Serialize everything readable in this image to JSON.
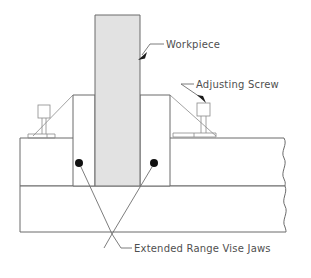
{
  "diagram": {
    "background_color": "#ffffff",
    "line_color": "#6b6b6b",
    "workpiece_fill": "#e2e2e2",
    "marker_color": "#111111"
  },
  "labels": {
    "workpiece": "Workpiece",
    "adjusting_screw": "Adjusting Screw",
    "vise_jaws": "Extended Range Vise Jaws"
  },
  "parts": {
    "workpiece": {
      "name": "workpiece",
      "x": 95,
      "y": 15,
      "width": 45,
      "height": 171
    },
    "left_jaw": {
      "name": "left-vise-jaw",
      "x": 73,
      "y": 95,
      "width": 22,
      "height": 91
    },
    "right_jaw": {
      "name": "right-vise-jaw",
      "x": 140,
      "y": 95,
      "width": 30,
      "height": 91
    },
    "vise_body_upper": {
      "name": "vise-body-upper",
      "x": 20,
      "y": 138,
      "width": 265,
      "height": 48
    },
    "vise_body_lower": {
      "name": "vise-body-lower",
      "x": 20,
      "y": 186,
      "width": 265,
      "height": 46
    },
    "left_adjusting_screw": {
      "name": "left-adjusting-screw",
      "x": 38,
      "y": 105,
      "width": 12,
      "height": 13
    },
    "right_adjusting_screw": {
      "name": "right-adjusting-screw",
      "x": 197,
      "y": 103,
      "width": 13,
      "height": 13
    },
    "left_jaw_marker": {
      "name": "left-jaw-marker",
      "cx": 79,
      "cy": 163,
      "r": 4
    },
    "right_jaw_marker": {
      "name": "right-jaw-marker",
      "cx": 154,
      "cy": 163,
      "r": 4
    }
  },
  "label_positions": {
    "workpiece": {
      "x": 166,
      "y": 48
    },
    "adjusting_screw": {
      "x": 196,
      "y": 88
    },
    "vise_jaws": {
      "x": 134,
      "y": 252
    }
  },
  "leaders": {
    "workpiece": {
      "name": "workpiece-leader",
      "path": "M 163 44 L 150 44 L 141 57",
      "arrow_tip": {
        "x": 140,
        "y": 59
      }
    },
    "adjusting_screw": {
      "name": "adjusting-screw-leader",
      "path": "M 193 84 L 180 84 L 206 100",
      "arrow_tip": {
        "x": 205,
        "y": 101
      }
    },
    "vise_jaws": {
      "name": "vise-jaws-leader",
      "path": "M 131 248 L 120 248 L 112 233 L 104 248 L 82 167 M 112 233 L 152 167"
    }
  }
}
